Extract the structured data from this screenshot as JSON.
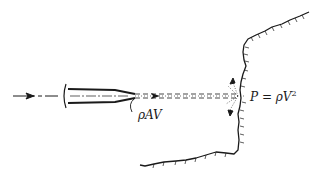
{
  "diagram": {
    "labels": {
      "mass_flux": "ρAV",
      "pressure_lhs": "P = ρV",
      "pressure_exp": "2"
    },
    "elements": [
      {
        "name": "incoming-flow-arrow",
        "kind": "arrow"
      },
      {
        "name": "nozzle",
        "kind": "shape"
      },
      {
        "name": "water-jet",
        "kind": "dashed-lines"
      },
      {
        "name": "jet-direction-arrow",
        "kind": "arrow"
      },
      {
        "name": "rock-wall",
        "kind": "terrain-outline"
      },
      {
        "name": "splash-deflection-arrows",
        "kind": "arrows"
      }
    ],
    "colors": {
      "ink": "#1a1a1a",
      "background": "#ffffff"
    }
  }
}
